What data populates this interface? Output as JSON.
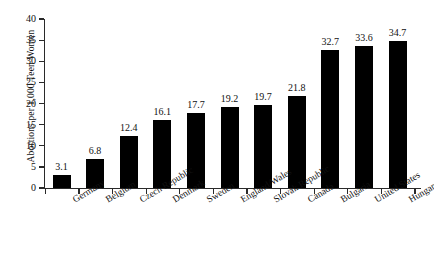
{
  "chart_data": {
    "type": "bar",
    "title": "",
    "subtitle": "",
    "xlabel": "",
    "ylabel": "Abortions per 1,000 Teen Women",
    "ylim": [
      0,
      40
    ],
    "yticks": [
      0,
      5,
      10,
      15,
      20,
      25,
      30,
      35,
      40
    ],
    "ytick_labels": [
      "0",
      "5",
      "10",
      "15",
      "20",
      "25",
      "30",
      "35",
      "40"
    ],
    "grid": false,
    "legend": null,
    "bar_color": "#000000",
    "axis_color": "#2a2a2a",
    "categories": [
      "Germany",
      "Belgium",
      "Czech Republic",
      "Denmark",
      "Sweden",
      "England/Wales",
      "Slovak Republic",
      "Canada",
      "Bulgaria",
      "United States",
      "Hungary"
    ],
    "values": [
      3.1,
      6.8,
      12.4,
      16.1,
      17.7,
      19.2,
      19.7,
      21.8,
      32.7,
      33.6,
      34.7
    ],
    "value_labels": [
      "3.1",
      "6.8",
      "12.4",
      "16.1",
      "17.7",
      "19.2",
      "19.7",
      "21.8",
      "32.7",
      "33.6",
      "34.7"
    ]
  }
}
